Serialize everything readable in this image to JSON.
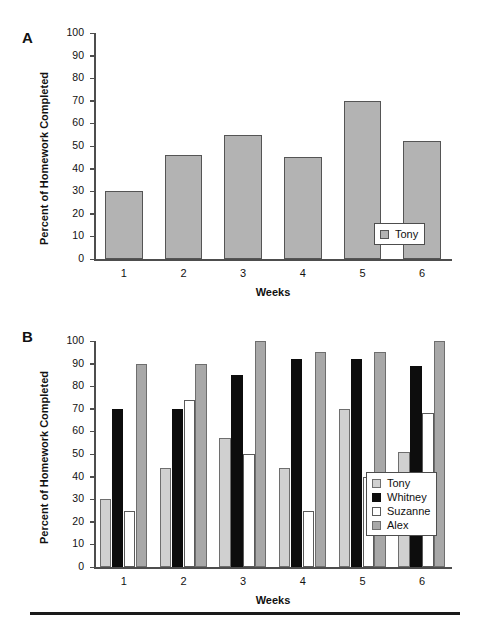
{
  "figure": {
    "panels": [
      {
        "letter": "A",
        "ylabel": "Percent of Homework Completed",
        "xlabel": "Weeks",
        "legend_labels": [
          "Tony"
        ]
      },
      {
        "letter": "B",
        "ylabel": "Percent of Homework Completed",
        "xlabel": "Weeks",
        "legend_labels": [
          "Tony",
          "Whitney",
          "Suzanne",
          "Alex"
        ]
      }
    ],
    "yticks": [
      "100",
      "90",
      "80",
      "70",
      "60",
      "50",
      "40",
      "30",
      "20",
      "10",
      "0"
    ],
    "xticks": [
      "1",
      "2",
      "3",
      "4",
      "5",
      "6"
    ],
    "colors": {
      "tony": "#d0d0d0",
      "whitney": "#0d0d0d",
      "suzanne": "#ffffff",
      "alex": "#a8a8a8",
      "single_bar": "#b3b3b3",
      "axis": "#4d4d4d",
      "text": "#111111"
    }
  },
  "chart_data": [
    {
      "type": "bar",
      "panel": "A",
      "title": "",
      "xlabel": "Weeks",
      "ylabel": "Percent of Homework Completed",
      "categories": [
        "1",
        "2",
        "3",
        "4",
        "5",
        "6"
      ],
      "values": [
        30,
        46,
        55,
        45,
        70,
        52
      ],
      "series": [
        {
          "name": "Tony",
          "values": [
            30,
            46,
            55,
            45,
            70,
            52
          ]
        }
      ],
      "ylim": [
        0,
        100
      ],
      "ytick_step": 10,
      "grid": false,
      "legend_position": "bottom-right"
    },
    {
      "type": "bar",
      "panel": "B",
      "title": "",
      "xlabel": "Weeks",
      "ylabel": "Percent of Homework Completed",
      "categories": [
        "1",
        "2",
        "3",
        "4",
        "5",
        "6"
      ],
      "series": [
        {
          "name": "Tony",
          "values": [
            30,
            44,
            57,
            44,
            70,
            51
          ]
        },
        {
          "name": "Whitney",
          "values": [
            70,
            70,
            85,
            92,
            92,
            89
          ]
        },
        {
          "name": "Suzanne",
          "values": [
            25,
            74,
            50,
            25,
            40,
            68
          ]
        },
        {
          "name": "Alex",
          "values": [
            90,
            90,
            100,
            95,
            95,
            100
          ]
        }
      ],
      "ylim": [
        0,
        100
      ],
      "ytick_step": 10,
      "grid": false,
      "legend_position": "bottom-right"
    }
  ]
}
